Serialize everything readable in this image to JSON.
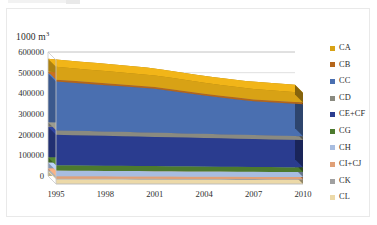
{
  "axis_unit_label": "1000 m",
  "axis_unit_exponent": "3",
  "legend": {
    "position": "right",
    "items": [
      {
        "label": "CA",
        "color": "#d8a215"
      },
      {
        "label": "CB",
        "color": "#b4651a"
      },
      {
        "label": "CC",
        "color": "#4a6fb0"
      },
      {
        "label": "CD",
        "color": "#8a8a80"
      },
      {
        "label": "CE+CF",
        "color": "#2a3c8f"
      },
      {
        "label": "CG",
        "color": "#4c7a2e"
      },
      {
        "label": "CH",
        "color": "#a8bde0"
      },
      {
        "label": "CI+CJ",
        "color": "#e0a077"
      },
      {
        "label": "CK",
        "color": "#a0a0a0"
      },
      {
        "label": "CL",
        "color": "#ecd9a8"
      }
    ]
  },
  "chart_data": {
    "type": "area",
    "stacked": true,
    "three_d": true,
    "title": "",
    "subtitle": "",
    "xlabel": "",
    "ylabel": "1000 m3",
    "x": [
      1995,
      1996,
      1997,
      1998,
      1999,
      2000,
      2001,
      2002,
      2003,
      2004,
      2005,
      2006,
      2007,
      2008,
      2009,
      2010
    ],
    "xtick_labels": [
      "1995",
      "1998",
      "2001",
      "2004",
      "2007",
      "2010"
    ],
    "xtick_values": [
      1995,
      1998,
      2001,
      2004,
      2007,
      2010
    ],
    "ytick_labels": [
      "0",
      "100000",
      "200000",
      "300000",
      "400000",
      "500000",
      "600000"
    ],
    "ytick_values": [
      0,
      100000,
      200000,
      300000,
      400000,
      500000,
      600000
    ],
    "ylim": [
      0,
      600000
    ],
    "xlim": [
      1995,
      2010
    ],
    "grid": true,
    "legend_position": "right",
    "series": [
      {
        "name": "CL",
        "color": "#ecd9a8",
        "values": [
          22000,
          21800,
          21600,
          21400,
          21200,
          21000,
          20800,
          20600,
          20400,
          20200,
          20000,
          19800,
          19600,
          19400,
          19200,
          19000
        ]
      },
      {
        "name": "CK",
        "color": "#a0a0a0",
        "values": [
          4000,
          4000,
          4000,
          4000,
          4000,
          4000,
          4000,
          4000,
          4000,
          4000,
          4000,
          4000,
          4000,
          4000,
          4000,
          4000
        ]
      },
      {
        "name": "CI+CJ",
        "color": "#e0a077",
        "values": [
          12000,
          11900,
          11800,
          11700,
          11600,
          11500,
          11400,
          11300,
          11200,
          11100,
          11000,
          10900,
          10800,
          10700,
          10600,
          10500
        ]
      },
      {
        "name": "CH",
        "color": "#a8bde0",
        "values": [
          27000,
          26800,
          26600,
          26400,
          26200,
          26000,
          25800,
          25600,
          25400,
          25200,
          25000,
          24800,
          24600,
          24400,
          24200,
          24000
        ]
      },
      {
        "name": "CG",
        "color": "#4c7a2e",
        "values": [
          26000,
          25800,
          25600,
          25400,
          25200,
          25000,
          24800,
          24600,
          24400,
          24200,
          24000,
          23800,
          23600,
          23400,
          23200,
          23000
        ]
      },
      {
        "name": "CE+CF",
        "color": "#2a3c8f",
        "values": [
          147000,
          146000,
          145000,
          144000,
          143000,
          142000,
          141000,
          140000,
          139000,
          138000,
          137000,
          136000,
          135000,
          134000,
          133000,
          132000
        ]
      },
      {
        "name": "CD",
        "color": "#8a8a80",
        "values": [
          22000,
          21800,
          21600,
          21400,
          21200,
          21000,
          20800,
          20600,
          20400,
          20200,
          20000,
          19800,
          19600,
          19400,
          19200,
          19000
        ]
      },
      {
        "name": "CC",
        "color": "#4a6fb0",
        "values": [
          236000,
          232000,
          228000,
          224000,
          220000,
          216000,
          212000,
          203000,
          194000,
          185000,
          177000,
          170000,
          163000,
          160000,
          157000,
          154000
        ]
      },
      {
        "name": "CB",
        "color": "#b4651a",
        "values": [
          9000,
          9000,
          9000,
          9000,
          9000,
          9000,
          9000,
          9000,
          9000,
          9000,
          9000,
          9000,
          9000,
          9000,
          9000,
          9000
        ]
      },
      {
        "name": "CA",
        "color": "#d8a215",
        "values": [
          62000,
          61000,
          60000,
          59000,
          58000,
          57000,
          56000,
          55000,
          54000,
          53000,
          52000,
          51000,
          50000,
          49000,
          48000,
          47000
        ]
      }
    ],
    "totals": [
      567000,
      560100,
      553200,
      546300,
      539400,
      532500,
      525600,
      508700,
      491800,
      474900,
      459000,
      445100,
      431200,
      424900,
      418400,
      412500
    ]
  }
}
